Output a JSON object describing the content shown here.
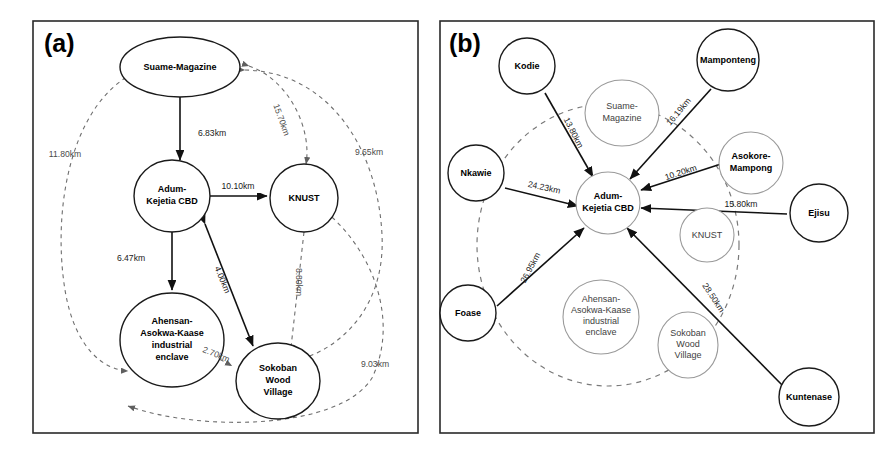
{
  "figure": {
    "background_color": "#ffffff",
    "width": 895,
    "height": 453,
    "solid_edge_color": "#111111",
    "dashed_edge_color": "#6e6e6e",
    "faint_node_color": "#9a9a9a"
  },
  "panels": [
    {
      "tag": "(a)",
      "name": "panel-a",
      "nodes": [
        {
          "id": "suame",
          "label": "Suame-Magazine",
          "style": "bold"
        },
        {
          "id": "adum",
          "label": "Adum-\nKejetia CBD",
          "style": "bold"
        },
        {
          "id": "knust",
          "label": "KNUST",
          "style": "bold"
        },
        {
          "id": "ahensan",
          "label": "Ahensan-\nAsokwa-Kaase\nindustrial\nenclave",
          "style": "bold"
        },
        {
          "id": "sokoban",
          "label": "Sokoban\nWood\nVillage",
          "style": "bold"
        }
      ],
      "edges": [
        {
          "from": "suame",
          "to": "adum",
          "distance": "6.83km",
          "line": "solid"
        },
        {
          "from": "adum",
          "to": "knust",
          "distance": "10.10km",
          "line": "solid"
        },
        {
          "from": "adum",
          "to": "ahensan",
          "distance": "6.47km",
          "line": "solid"
        },
        {
          "from": "adum",
          "to": "sokoban",
          "distance": "4.00km",
          "line": "solid"
        },
        {
          "from": "suame",
          "to": "knust",
          "distance": "15.70km",
          "line": "dashed"
        },
        {
          "from": "knust",
          "to": "sokoban",
          "distance": "8.80km",
          "line": "dashed"
        },
        {
          "from": "ahensan",
          "to": "sokoban",
          "distance": "2.70km",
          "line": "dashed"
        },
        {
          "from": "suame",
          "to": "ahensan",
          "distance": "11.80km",
          "line": "dashed"
        },
        {
          "from": "suame",
          "to": "sokoban",
          "distance": "9.65km",
          "line": "dashed"
        },
        {
          "from": "knust",
          "to": "ahensan",
          "distance": "9.03km",
          "line": "dashed"
        }
      ]
    },
    {
      "tag": "(b)",
      "name": "panel-b",
      "hub": {
        "id": "adum_b",
        "label": "Adum-\nKejetia CBD"
      },
      "inner_nodes": [
        {
          "id": "suame_b",
          "label": "Suame-\nMagazine"
        },
        {
          "id": "knust_b",
          "label": "KNUST"
        },
        {
          "id": "ahensan_b",
          "label": "Ahensan-\nAsokwa-Kaase\nindustrial\nenclave"
        },
        {
          "id": "sokoban_b",
          "label": "Sokoban\nWood\nVillage"
        }
      ],
      "outer_nodes": [
        {
          "id": "kodie",
          "label": "Kodie",
          "distance": "13.80km"
        },
        {
          "id": "mamponteng",
          "label": "Mamponteng",
          "distance": "16.19km"
        },
        {
          "id": "asokore",
          "label": "Asokore-\nMampong",
          "distance": "10.20km"
        },
        {
          "id": "ejisu",
          "label": "Ejisu",
          "distance": "15.80km"
        },
        {
          "id": "nkawie",
          "label": "Nkawie",
          "distance": "24.23km"
        },
        {
          "id": "foase",
          "label": "Foase",
          "distance": "26.95km"
        },
        {
          "id": "kuntenase",
          "label": "Kuntenase",
          "distance": "28.50km"
        }
      ]
    }
  ]
}
